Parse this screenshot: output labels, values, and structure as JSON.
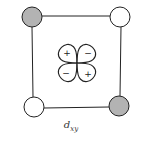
{
  "diagram": {
    "type": "orbital-ligand-field",
    "caption": {
      "main": "d",
      "subscript": "xy"
    },
    "square": {
      "stroke": "#222222",
      "corners": {
        "top_left": [
          32,
          16
        ],
        "top_right": [
          120,
          16
        ],
        "bottom_right": [
          120,
          107
        ],
        "bottom_left": [
          33,
          107
        ]
      }
    },
    "ligands": [
      {
        "position": "top-left",
        "cx": 32,
        "cy": 17,
        "r": 10,
        "shaded": true,
        "fill": "#b3b3b3"
      },
      {
        "position": "top-right",
        "cx": 120,
        "cy": 17,
        "r": 10,
        "shaded": false,
        "fill": "#ffffff"
      },
      {
        "position": "bottom-left",
        "cx": 34,
        "cy": 107,
        "r": 10,
        "shaded": false,
        "fill": "#ffffff"
      },
      {
        "position": "bottom-right",
        "cx": 119,
        "cy": 106,
        "r": 10,
        "shaded": true,
        "fill": "#b3b3b3"
      }
    ],
    "orbital": {
      "center": [
        77,
        63
      ],
      "lobes": [
        {
          "position": "top-left",
          "sign": "+"
        },
        {
          "position": "top-right",
          "sign": "−"
        },
        {
          "position": "bottom-left",
          "sign": "−"
        },
        {
          "position": "bottom-right",
          "sign": "+"
        }
      ]
    }
  }
}
